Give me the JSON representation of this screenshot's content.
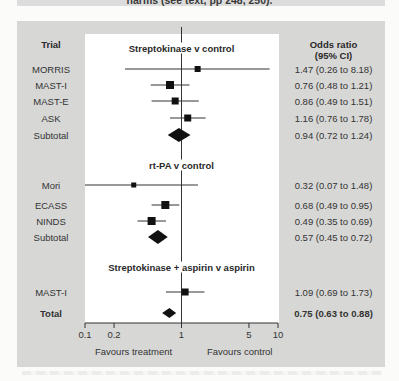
{
  "caption": "harms (see text, pp 248, 250).",
  "headers": {
    "trial": "Trial",
    "odds_ratio_line1": "Odds ratio",
    "odds_ratio_line2": "(95% CI)"
  },
  "axis": {
    "ticks": [
      "0.1",
      "0.2",
      "1",
      "5",
      "10"
    ],
    "favours_left": "Favours treatment",
    "favours_right": "Favours control"
  },
  "chart_data": {
    "type": "forest",
    "title": "",
    "xlabel": "Odds ratio (log scale)",
    "xscale": "log",
    "xlim": [
      0.1,
      10
    ],
    "xticks": [
      0.1,
      0.2,
      1,
      5,
      10
    ],
    "reference_line": 1,
    "axis_annotations": {
      "left": "Favours treatment",
      "right": "Favours control"
    },
    "groups": [
      {
        "name": "Streptokinase v control",
        "rows": [
          {
            "trial": "MORRIS",
            "or": 1.47,
            "lo": 0.26,
            "hi": 8.18,
            "text": "1.47 (0.26 to 8.18)",
            "size": 6
          },
          {
            "trial": "MAST-I",
            "or": 0.76,
            "lo": 0.48,
            "hi": 1.21,
            "text": "0.76 (0.48 to 1.21)",
            "size": 8
          },
          {
            "trial": "MAST-E",
            "or": 0.86,
            "lo": 0.49,
            "hi": 1.51,
            "text": "0.86 (0.49 to 1.51)",
            "size": 7
          },
          {
            "trial": "ASK",
            "or": 1.16,
            "lo": 0.76,
            "hi": 1.78,
            "text": "1.16 (0.76 to 1.78)",
            "size": 7
          }
        ],
        "subtotal": {
          "label": "Subtotal",
          "or": 0.94,
          "lo": 0.72,
          "hi": 1.24,
          "text": "0.94 (0.72 to 1.24)"
        }
      },
      {
        "name": "rt-PA v control",
        "rows": [
          {
            "trial": "Mori",
            "or": 0.32,
            "lo": 0.07,
            "hi": 1.48,
            "text": "0.32 (0.07 to 1.48)",
            "size": 5
          },
          {
            "trial": "ECASS",
            "or": 0.68,
            "lo": 0.49,
            "hi": 0.95,
            "text": "0.68 (0.49 to 0.95)",
            "size": 8
          },
          {
            "trial": "NINDS",
            "or": 0.49,
            "lo": 0.35,
            "hi": 0.69,
            "text": "0.49 (0.35 to 0.69)",
            "size": 8
          }
        ],
        "subtotal": {
          "label": "Subtotal",
          "or": 0.57,
          "lo": 0.45,
          "hi": 0.72,
          "text": "0.57 (0.45 to 0.72)"
        }
      },
      {
        "name": "Streptokinase + aspirin v aspirin",
        "rows": [
          {
            "trial": "MAST-I",
            "or": 1.09,
            "lo": 0.69,
            "hi": 1.73,
            "text": "1.09 (0.69 to 1.73)",
            "size": 7
          }
        ]
      }
    ],
    "total": {
      "label": "Total",
      "or": 0.75,
      "lo": 0.63,
      "hi": 0.88,
      "text": "0.75 (0.63 to 0.88)"
    }
  },
  "colors": {
    "box_background": "#d7d7d6",
    "panel_background": "#ffffff",
    "marker": "#111111",
    "line": "#333333"
  }
}
